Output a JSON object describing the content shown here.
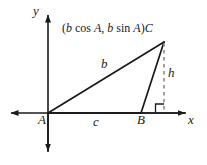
{
  "figure": {
    "kind": "geometry-diagram",
    "axes": {
      "y_label": "y",
      "x_label": "x",
      "origin_label": "A"
    },
    "vertices": {
      "a_label": "A",
      "b_label": "B",
      "c_label": "C"
    },
    "sides": {
      "b_label": "b",
      "c_label": "c",
      "h_label": "h"
    },
    "coordinate_label": {
      "open_paren": "(",
      "b1": "b",
      "cos": "cos",
      "a1": "A",
      "comma": ", ",
      "b2": "b",
      "sin": "sin",
      "a2": "A",
      "close_paren": ")",
      "point": "C",
      "full_text": "(b cos A, b sin A)C"
    },
    "colors": {
      "stroke": "#1a1a1a",
      "dashed": "#8c8c8c",
      "background": "#ffffff"
    },
    "geometry": {
      "origin": [
        48,
        113
      ],
      "point_b": [
        141,
        113
      ],
      "point_c": [
        164,
        42
      ],
      "foot_of_altitude": [
        164,
        113
      ],
      "x_axis_from": [
        10,
        113
      ],
      "x_axis_to": [
        186,
        113
      ],
      "y_axis_from": [
        48,
        14
      ],
      "y_axis_to": [
        48,
        152
      ]
    }
  }
}
